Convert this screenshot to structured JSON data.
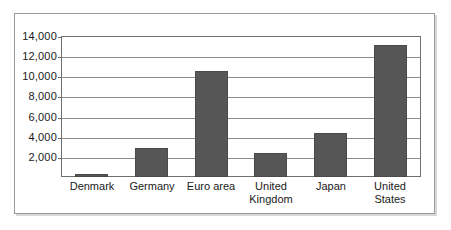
{
  "chart_data": {
    "type": "bar",
    "title": "",
    "subtitle": "",
    "xlabel": "",
    "ylabel": "",
    "categories": [
      "Denmark",
      "Germany",
      "Euro area",
      "United Kingdom",
      "Japan",
      "United States"
    ],
    "category_lines": [
      [
        "Denmark"
      ],
      [
        "Germany"
      ],
      [
        "Euro area"
      ],
      [
        "United",
        "Kingdom"
      ],
      [
        "Japan"
      ],
      [
        "United",
        "States"
      ]
    ],
    "values": [
      260,
      2850,
      10550,
      2400,
      4350,
      13150
    ],
    "ylim": [
      0,
      14000
    ],
    "ytick_values": [
      2000,
      4000,
      6000,
      8000,
      10000,
      12000,
      14000
    ],
    "ytick_labels": [
      "2,000",
      "4,000",
      "6,000",
      "8,000",
      "10,000",
      "12,000",
      "14,000"
    ],
    "grid": true,
    "legend": null,
    "legend_position": "none",
    "bar_color": "#565656",
    "grid_color": "#8c8c8c",
    "axis_color": "#6f6f6f",
    "background_color": "#ffffff",
    "border_color": "#9a9a9a"
  }
}
